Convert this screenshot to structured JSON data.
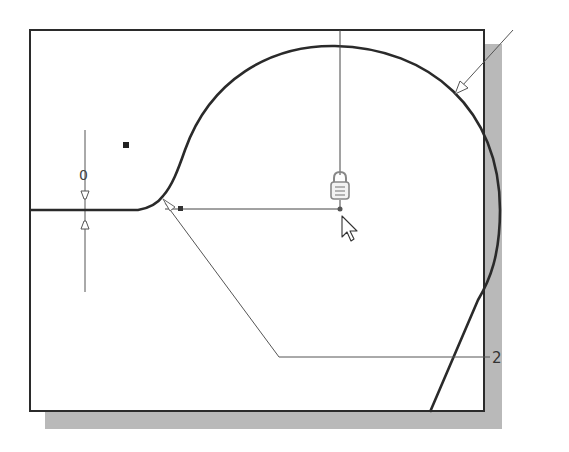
{
  "figure": {
    "dimension_label": "2",
    "origin_label": "0",
    "colors": {
      "background": "#ffffff",
      "frame_border": "#2b2b2b",
      "shadow": "#b9b9b9",
      "sketch_line": "#2a2a2a",
      "construction_line": "#555555"
    },
    "icons": [
      "lock-icon",
      "cursor-arrow-icon",
      "coincident-constraint-icon",
      "tangent-constraint-icon",
      "point-marker-icon"
    ]
  }
}
